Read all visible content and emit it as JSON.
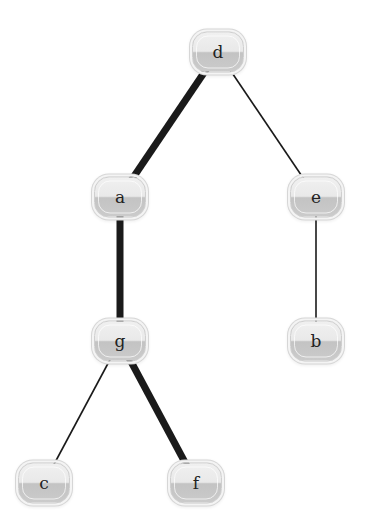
{
  "diagram": {
    "type": "tree",
    "colors": {
      "background": "#ffffff",
      "edge": "#1a1a1a",
      "node_top": "#ececec",
      "node_bottom": "#c5c5c5",
      "node_border": "#cfcfcf",
      "label": "#222222"
    },
    "nodes": [
      {
        "id": "d",
        "label": "d",
        "x": 218,
        "y": 52
      },
      {
        "id": "a",
        "label": "a",
        "x": 120,
        "y": 197
      },
      {
        "id": "e",
        "label": "e",
        "x": 316,
        "y": 197
      },
      {
        "id": "g",
        "label": "g",
        "x": 120,
        "y": 341
      },
      {
        "id": "b",
        "label": "b",
        "x": 316,
        "y": 341
      },
      {
        "id": "c",
        "label": "c",
        "x": 44,
        "y": 483
      },
      {
        "id": "f",
        "label": "f",
        "x": 196,
        "y": 483
      }
    ],
    "edges": [
      {
        "from": "d",
        "to": "a",
        "weight": "thick"
      },
      {
        "from": "d",
        "to": "e",
        "weight": "thin"
      },
      {
        "from": "a",
        "to": "g",
        "weight": "thick"
      },
      {
        "from": "e",
        "to": "b",
        "weight": "thin"
      },
      {
        "from": "g",
        "to": "c",
        "weight": "thin"
      },
      {
        "from": "g",
        "to": "f",
        "weight": "thick"
      }
    ],
    "edge_widths": {
      "thick": 7,
      "thin": 1.6
    }
  }
}
